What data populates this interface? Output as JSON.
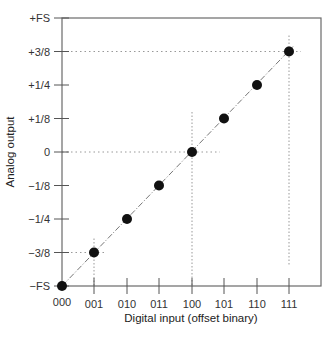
{
  "chart_data": {
    "type": "scatter",
    "title": "",
    "xlabel": "Digital input (offset binary)",
    "ylabel": "Analog output",
    "categories": [
      "000",
      "001",
      "010",
      "011",
      "100",
      "101",
      "110",
      "111"
    ],
    "y_tick_labels": [
      "−FS",
      "−3/8",
      "−1/4",
      "−1/8",
      "0",
      "+1/8",
      "+1/4",
      "+3/8",
      "+FS"
    ],
    "y_tick_values": [
      -0.5,
      -0.375,
      -0.25,
      -0.125,
      0,
      0.125,
      0.25,
      0.375,
      0.5
    ],
    "series": [
      {
        "name": "DAC transfer function",
        "x": [
          "000",
          "001",
          "010",
          "011",
          "100",
          "101",
          "110",
          "111"
        ],
        "values": [
          -0.5,
          -0.375,
          -0.25,
          -0.125,
          0,
          0.125,
          0.25,
          0.375
        ]
      }
    ],
    "ylim": [
      -0.5,
      0.5
    ],
    "grid": false,
    "legend": "none",
    "annotations": [
      "dash-dot ideal line through all points",
      "dotted guide lines at 001 (-3/8), 100 (0), 111 (+3/8)"
    ]
  },
  "layout": {
    "frame": {
      "left": 62,
      "top": 18,
      "right": 321,
      "bottom": 286
    },
    "x_positions": [
      62,
      94,
      127,
      159,
      192,
      224,
      257,
      289
    ],
    "colors": {
      "frame": "#555555",
      "point": "#111111",
      "guide": "#888888",
      "text": "#333333"
    }
  }
}
